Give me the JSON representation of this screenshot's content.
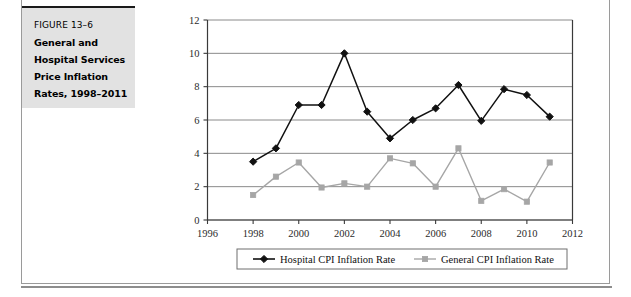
{
  "figure": {
    "label": "FIGURE 13–6",
    "title_lines": [
      "General and",
      "Hospital Services",
      "Price Inflation",
      "Rates, 1998–2011"
    ]
  },
  "chart_data": {
    "type": "line",
    "title": "",
    "xlabel": "",
    "ylabel": "",
    "xlim": [
      1996,
      2012
    ],
    "ylim": [
      0,
      12
    ],
    "xticks": [
      "1996",
      "1998",
      "2000",
      "2002",
      "2004",
      "2006",
      "2008",
      "2010",
      "2012"
    ],
    "yticks": [
      "0",
      "2",
      "4",
      "6",
      "8",
      "10",
      "12"
    ],
    "grid": "horizontal",
    "legend_position": "bottom",
    "x": [
      1998,
      1999,
      2000,
      2001,
      2002,
      2003,
      2004,
      2005,
      2006,
      2007,
      2008,
      2009,
      2010,
      2011
    ],
    "series": [
      {
        "name": "Hospital CPI Inflation Rate",
        "color": "#111111",
        "marker": "diamond",
        "values": [
          3.5,
          4.3,
          6.9,
          6.9,
          10.0,
          6.5,
          4.9,
          6.0,
          6.7,
          8.1,
          5.95,
          7.85,
          7.5,
          6.2
        ]
      },
      {
        "name": "General CPI Inflation Rate",
        "color": "#a6a6a6",
        "marker": "square",
        "values": [
          1.5,
          2.6,
          3.45,
          1.95,
          2.2,
          2.0,
          3.7,
          3.4,
          2.0,
          4.3,
          1.15,
          1.85,
          1.1,
          3.45
        ]
      }
    ]
  },
  "colors": {
    "hospital_series": "#111111",
    "general_series": "#a6a6a6",
    "gridline": "#8a8a8a",
    "axis": "#3a3a3a",
    "caption_bg": "#e2e2e2"
  }
}
